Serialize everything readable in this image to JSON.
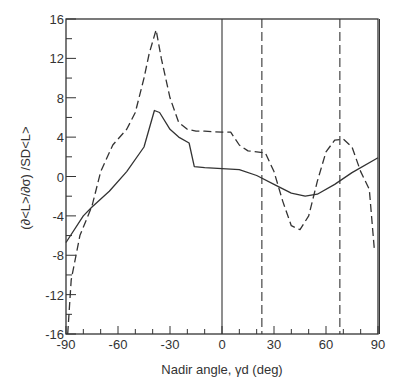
{
  "chart_data": {
    "type": "line",
    "title": "",
    "xlabel": "Nadir angle, γd (deg)",
    "ylabel": "(∂<L>/∂σ) /SD<L>",
    "xlim": [
      -90,
      90
    ],
    "ylim": [
      -16,
      16
    ],
    "grid": false,
    "legend": null,
    "x_ticks": [
      -90,
      -60,
      -30,
      0,
      30,
      60,
      90
    ],
    "x_tick_labels": [
      "-90",
      "-60",
      "-30",
      "0",
      "30",
      "60",
      "90"
    ],
    "y_ticks": [
      -16,
      -12,
      -8,
      -4,
      0,
      4,
      8,
      12,
      16
    ],
    "y_tick_labels": [
      "-16",
      "-12",
      "-8",
      "-4",
      "0",
      "4",
      "8",
      "12",
      "16"
    ],
    "vertical_lines": [
      {
        "x": 0,
        "style": "solid"
      },
      {
        "x": 23,
        "style": "dashed"
      },
      {
        "x": 68,
        "style": "dashed"
      }
    ],
    "series": [
      {
        "name": "solid",
        "style": "solid",
        "x": [
          -90,
          -80,
          -75,
          -65,
          -55,
          -45,
          -39,
          -36,
          -30,
          -25,
          -19,
          -16,
          -10,
          0,
          10,
          20,
          30,
          40,
          48,
          55,
          65,
          75,
          90
        ],
        "values": [
          -6.7,
          -4.0,
          -3.1,
          -1.5,
          0.5,
          3.0,
          6.7,
          6.5,
          4.8,
          4.0,
          3.4,
          1.0,
          0.9,
          0.8,
          0.7,
          0.1,
          -0.8,
          -1.7,
          -2.0,
          -1.8,
          -0.8,
          0.4,
          1.9
        ]
      },
      {
        "name": "dashed",
        "style": "dashed",
        "x": [
          -89,
          -87,
          -82,
          -75,
          -70,
          -63,
          -55,
          -50,
          -45,
          -42,
          -38,
          -35,
          -30,
          -25,
          -20,
          -15,
          -10,
          0,
          5,
          10,
          15,
          20,
          25,
          30,
          35,
          40,
          45,
          50,
          55,
          60,
          65,
          70,
          75,
          80,
          85,
          88
        ],
        "values": [
          -16,
          -10.5,
          -6.0,
          -3.0,
          0.5,
          3.2,
          4.8,
          6.5,
          10.0,
          12.5,
          14.9,
          12.0,
          8.0,
          5.5,
          4.8,
          4.6,
          4.6,
          4.5,
          4.5,
          3.2,
          2.6,
          2.5,
          2.4,
          0.5,
          -2.5,
          -5.0,
          -5.4,
          -4.0,
          -0.5,
          2.5,
          3.7,
          3.8,
          3.0,
          0.5,
          -1.3,
          -7.6
        ]
      }
    ]
  }
}
